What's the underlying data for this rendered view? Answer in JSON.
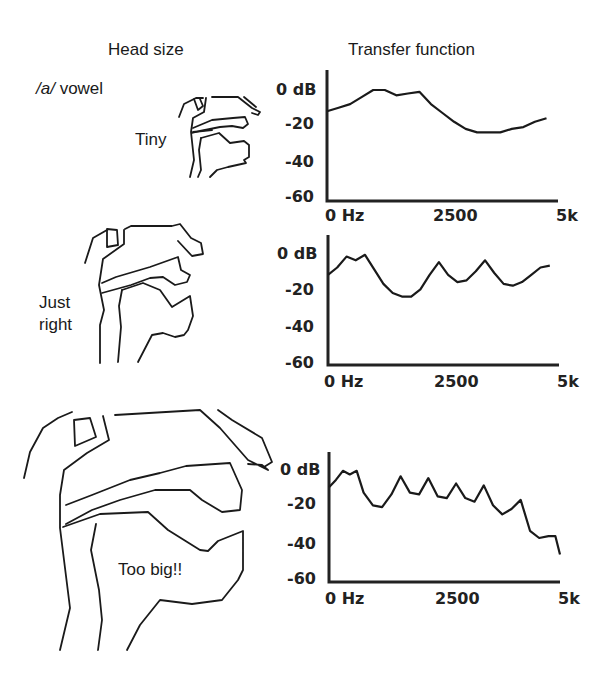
{
  "headers": {
    "left": "Head size",
    "right": "Transfer function"
  },
  "vowel_label": {
    "slash_a": "/a/",
    "word": " vowel"
  },
  "rows": [
    {
      "label_lines": [
        "Tiny"
      ]
    },
    {
      "label_lines": [
        "Just",
        "right"
      ]
    },
    {
      "label_lines": [
        "Too big!!"
      ]
    }
  ],
  "axis_labels": {
    "y": [
      "0  dB",
      "-20",
      "-40",
      "-60"
    ],
    "x": [
      "0  Hz",
      "2500",
      "5k"
    ]
  },
  "chart_data": [
    {
      "type": "line",
      "title": "Transfer function — Tiny head",
      "xlabel": "Frequency (Hz)",
      "ylabel": "dB",
      "xlim": [
        0,
        5000
      ],
      "ylim": [
        -60,
        0
      ],
      "x_ticks": [
        "0 Hz",
        "2500",
        "5k"
      ],
      "y_ticks": [
        "0 dB",
        "-20",
        "-40",
        "-60"
      ],
      "grid": false,
      "x": [
        0,
        250,
        500,
        750,
        1000,
        1250,
        1500,
        1750,
        2000,
        2250,
        2500,
        2750,
        3000,
        3250,
        3500,
        3750,
        4000,
        4250,
        4500,
        4750
      ],
      "values": [
        -12,
        -10,
        -8,
        -4,
        0,
        0,
        -3,
        -2,
        -1,
        -8,
        -13,
        -18,
        -22,
        -24,
        -24,
        -24,
        -22,
        -21,
        -18,
        -16
      ]
    },
    {
      "type": "line",
      "title": "Transfer function — Just right head",
      "xlabel": "Frequency (Hz)",
      "ylabel": "dB",
      "xlim": [
        0,
        5000
      ],
      "ylim": [
        -60,
        0
      ],
      "x_ticks": [
        "0 Hz",
        "2500",
        "5k"
      ],
      "y_ticks": [
        "0 dB",
        "-20",
        "-40",
        "-60"
      ],
      "grid": false,
      "x": [
        0,
        200,
        400,
        600,
        800,
        1000,
        1200,
        1400,
        1600,
        1800,
        2000,
        2200,
        2400,
        2600,
        2800,
        3000,
        3200,
        3400,
        3600,
        3800,
        4000,
        4200,
        4400,
        4600,
        4800
      ],
      "values": [
        -12,
        -8,
        -2,
        -4,
        -1,
        -9,
        -17,
        -22,
        -24,
        -24,
        -20,
        -12,
        -5,
        -12,
        -16,
        -15,
        -10,
        -4,
        -11,
        -17,
        -18,
        -16,
        -12,
        -8,
        -7
      ]
    },
    {
      "type": "line",
      "title": "Transfer function — Too big head",
      "xlabel": "Frequency (Hz)",
      "ylabel": "dB",
      "xlim": [
        0,
        5000
      ],
      "ylim": [
        -60,
        0
      ],
      "x_ticks": [
        "0 Hz",
        "2500",
        "5k"
      ],
      "y_ticks": [
        "0 dB",
        "-20",
        "-40",
        "-60"
      ],
      "grid": false,
      "x": [
        0,
        150,
        300,
        450,
        600,
        750,
        950,
        1150,
        1350,
        1550,
        1750,
        1950,
        2150,
        2350,
        2550,
        2750,
        2950,
        3150,
        3350,
        3550,
        3750,
        3950,
        4150,
        4350,
        4550,
        4750,
        4900,
        5000
      ],
      "values": [
        -10,
        -6,
        -1,
        -3,
        -1,
        -13,
        -20,
        -21,
        -14,
        -4,
        -13,
        -14,
        -5,
        -15,
        -16,
        -8,
        -16,
        -18,
        -9,
        -20,
        -25,
        -22,
        -17,
        -34,
        -38,
        -37,
        -37,
        -47
      ]
    }
  ]
}
